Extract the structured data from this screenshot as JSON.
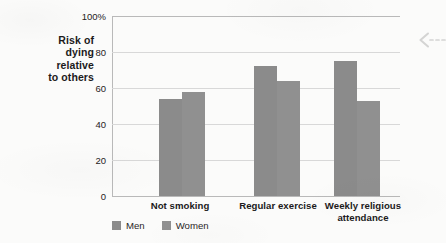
{
  "chart_data": {
    "type": "bar",
    "title": "",
    "subtitle": "",
    "xlabel": "",
    "ylabel": "Risk of dying relative to others",
    "ylabel_lines": [
      "Risk of",
      "dying",
      "relative",
      "to others"
    ],
    "categories": [
      "Not smoking",
      "Regular exercise",
      "Weekly religious attendance"
    ],
    "category_lines": [
      [
        "Not smoking"
      ],
      [
        "Regular exercise"
      ],
      [
        "Weekly religious",
        "attendance"
      ]
    ],
    "series": [
      {
        "name": "Men",
        "color": "#8b8b8b",
        "values": [
          54,
          72,
          75
        ]
      },
      {
        "name": "Women",
        "color": "#909090",
        "values": [
          58,
          64,
          53
        ]
      }
    ],
    "ylim": [
      0,
      100
    ],
    "yticks": [
      0,
      20,
      40,
      60,
      80,
      100
    ],
    "ytick_labels": [
      "0",
      "20",
      "40",
      "60",
      "80",
      "100%"
    ],
    "grid": true,
    "legend_position": "bottom-left",
    "legend_entries": [
      "Men",
      "Women"
    ],
    "annotations": [
      {
        "name": "dashed-left-arrow",
        "glyph": "left-arrow-with-dashes",
        "position": "right-edge"
      }
    ],
    "colors": {
      "background": "#fbfbfa",
      "axis": "#b9b9b9",
      "gridline": "#d8d8d8",
      "text": "#1c1a1b",
      "men_bar": "#8b8b8b",
      "women_bar": "#909090"
    }
  }
}
